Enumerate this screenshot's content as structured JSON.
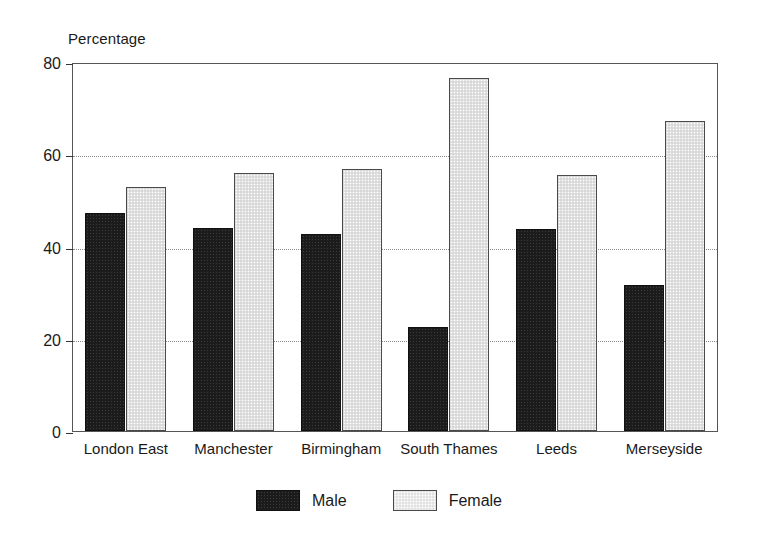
{
  "chart_data": {
    "type": "bar",
    "title": "",
    "ylabel": "Percentage",
    "xlabel": "",
    "ylim": [
      0,
      80
    ],
    "yticks": [
      0,
      20,
      40,
      60,
      80
    ],
    "ytick_labels": [
      "0",
      "20",
      "40",
      "60",
      "80"
    ],
    "grid": "horizontal-dotted",
    "legend_position": "bottom-center",
    "categories": [
      "London East",
      "Manchester",
      "Birmingham",
      "South Thames",
      "Leeds",
      "Merseyside"
    ],
    "series": [
      {
        "name": "Male",
        "color": "#1c1c1c",
        "values": [
          47.2,
          44.1,
          42.8,
          22.6,
          43.7,
          31.6
        ]
      },
      {
        "name": "Female",
        "color": "#e2e2e2",
        "values": [
          53.0,
          55.9,
          56.8,
          76.5,
          55.6,
          67.2
        ]
      }
    ]
  },
  "legend": {
    "items": [
      {
        "label": "Male",
        "swatch": "male"
      },
      {
        "label": "Female",
        "swatch": "female"
      }
    ]
  }
}
